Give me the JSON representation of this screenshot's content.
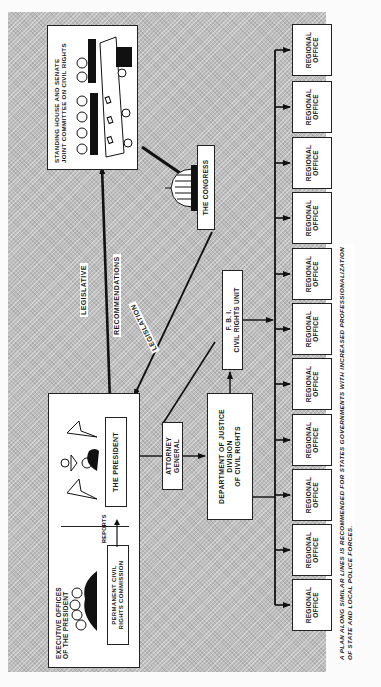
{
  "diagram": {
    "orientation": "rotated 90 degrees counter-clockwise",
    "nodes": {
      "executive_offices": {
        "title_line1": "EXECUTIVE  OFFICES",
        "title_line2": "OF THE PRESIDENT"
      },
      "permanent_commission": {
        "line1": "PERMANENT  CIVIL",
        "line2": "RIGHTS COMMISSION"
      },
      "president": {
        "label": "THE  PRESIDENT"
      },
      "committee": {
        "line1": "STANDING HOUSE AND SENATE",
        "line2": "JOINT COMMITTEE ON CIVIL RIGHTS"
      },
      "congress": {
        "label": "THE CONGRESS"
      },
      "attorney_general": {
        "line1": "ATTORNEY",
        "line2": "GENERAL"
      },
      "doj": {
        "line1": "DEPARTMENT OF JUSTICE",
        "line2": "DIVISION",
        "line3": "OF CIVIL RIGHTS"
      },
      "fbi": {
        "line1": "F. B. I.",
        "line2": "CIVIL RIGHTS UNIT"
      },
      "regional_offices": [
        {
          "line1": "REGIONAL",
          "line2": "OFFICE"
        },
        {
          "line1": "REGIONAL",
          "line2": "OFFICE"
        },
        {
          "line1": "REGIONAL",
          "line2": "OFFICE"
        },
        {
          "line1": "REGIONAL",
          "line2": "OFFICE"
        },
        {
          "line1": "REGIONAL",
          "line2": "OFFICE"
        },
        {
          "line1": "REGIONAL",
          "line2": "OFFICE"
        },
        {
          "line1": "REGIONAL",
          "line2": "OFFICE"
        },
        {
          "line1": "REGIONAL",
          "line2": "OFFICE"
        },
        {
          "line1": "REGIONAL",
          "line2": "OFFICE"
        },
        {
          "line1": "REGIONAL",
          "line2": "OFFICE"
        },
        {
          "line1": "REGIONAL",
          "line2": "OFFICE"
        }
      ]
    },
    "edge_labels": {
      "reports": "REPORTS",
      "legislative_recommendations_line1": "LEGISLATIVE",
      "legislative_recommendations_line2": "RECOMMENDATIONS",
      "legislation": "LEGISLATION"
    },
    "edges": [
      {
        "from": "permanent_commission",
        "to": "president",
        "label": "REPORTS"
      },
      {
        "from": "president",
        "to": "committee",
        "label": "LEGISLATIVE RECOMMENDATIONS"
      },
      {
        "from": "committee",
        "to": "congress"
      },
      {
        "from": "congress",
        "to": "president",
        "label": "LEGISLATION"
      },
      {
        "from": "president",
        "to": "attorney_general"
      },
      {
        "from": "attorney_general",
        "to": "doj"
      },
      {
        "from": "doj",
        "to": "fbi"
      },
      {
        "from": "fbi",
        "to": "regional_offices"
      },
      {
        "from": "doj",
        "to": "regional_offices"
      }
    ],
    "caption_line1": "A PLAN  ALONG  SIMILAR  LINES  IS  RECOMMENDED  FOR  STATES  GOVERNMENTS  WITH  INCREASED  PROFESSIONALIZATION",
    "caption_line2": "OF  STATE  AND  LOCAL  POLICE  FORCES.",
    "colors": {
      "background_tint": "#bdbdbd",
      "box_fill": "#ffffff",
      "ink": "#1a1a1a"
    }
  }
}
